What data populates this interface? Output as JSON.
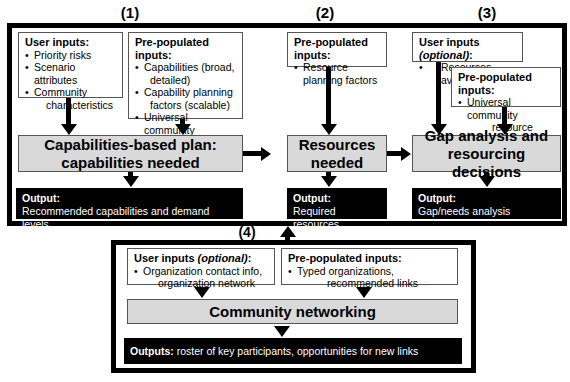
{
  "sections": {
    "s1": {
      "label": "(1)",
      "user_inputs": {
        "heading": "User inputs:",
        "items": [
          "Priority risks",
          "Scenario attributes",
          "Community",
          "characteristics"
        ]
      },
      "prepopulated": {
        "heading": "Pre-populated inputs:",
        "items": [
          {
            "line1": "Capabilities (broad,",
            "line2": "detailed)"
          },
          {
            "line1": "Capability planning",
            "line2": "factors (scalable)"
          },
          {
            "line1": "Universal community",
            "line2": "demographic data"
          }
        ]
      },
      "process": {
        "line1": "Capabilities-based plan:",
        "line2": "capabilities needed"
      },
      "output": {
        "heading": "Output:",
        "text": "Recommended capabilities and demand levels"
      }
    },
    "s2": {
      "label": "(2)",
      "prepopulated": {
        "heading": "Pre-populated inputs:",
        "items": [
          "Resource planning factors"
        ]
      },
      "process": {
        "line1": "Resources",
        "line2": "needed"
      },
      "output": {
        "heading": "Output:",
        "text": "Required resources"
      }
    },
    "s3": {
      "label": "(3)",
      "user_inputs": {
        "heading_main": "User inputs ",
        "heading_italic": "(optional)",
        "heading_end": ":",
        "items": [
          "Resources available"
        ]
      },
      "prepopulated": {
        "heading": "Pre-populated inputs:",
        "items": [
          {
            "line1": "Universal community",
            "line2": "resource data"
          }
        ]
      },
      "process": {
        "line1": "Gap analysis and",
        "line2": "resourcing decisions"
      },
      "output": {
        "heading": "Output:",
        "text": "Gap/needs analysis"
      }
    },
    "s4": {
      "label": "(4)",
      "user_inputs": {
        "heading_main": "User inputs ",
        "heading_italic": "(optional)",
        "heading_end": ":",
        "items": [
          {
            "line1": "Organization contact info,",
            "line2": "organization network"
          }
        ]
      },
      "prepopulated": {
        "heading": "Pre-populated inputs:",
        "items": [
          {
            "line1": "Typed organizations,",
            "line2": "recommended links"
          }
        ]
      },
      "process": {
        "line1": "Community networking"
      },
      "output": {
        "heading": "Outputs:",
        "text": " roster of key participants, opportunities for new links"
      }
    }
  },
  "colors": {
    "process_fill": "#d9d9d9",
    "output_fill": "#000000",
    "frame": "#000000"
  }
}
